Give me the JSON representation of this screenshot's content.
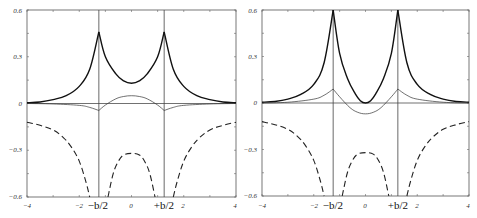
{
  "chart_data": [
    {
      "type": "line",
      "title": "",
      "xlabel": "",
      "ylabel": "",
      "xlim": [
        -4,
        4
      ],
      "ylim": [
        -0.6,
        0.6
      ],
      "grid": false,
      "x_ticks": [
        "-4",
        "-2",
        "0",
        "2",
        "4"
      ],
      "y_ticks": [
        "0.6",
        "0.3",
        "0",
        "-0.3",
        "-0.6"
      ],
      "annotations": [
        "-b/2",
        "+b/2"
      ],
      "vertical_lines_at": [
        -1.25,
        1.25
      ],
      "series": [
        {
          "name": "thick-solid",
          "style": "solid-thick",
          "x": [
            -4,
            -3.5,
            -3,
            -2.5,
            -2,
            -1.6,
            -1.25,
            -1.0,
            -0.6,
            -0.3,
            0,
            0.3,
            0.6,
            1.0,
            1.25,
            1.6,
            2,
            2.5,
            3,
            3.5,
            4
          ],
          "values": [
            0.005,
            0.01,
            0.025,
            0.05,
            0.11,
            0.22,
            0.46,
            0.3,
            0.19,
            0.145,
            0.13,
            0.145,
            0.19,
            0.3,
            0.46,
            0.22,
            0.11,
            0.05,
            0.025,
            0.01,
            0.005
          ]
        },
        {
          "name": "thin-solid",
          "style": "solid-thin",
          "x": [
            -4,
            -3,
            -2,
            -1.6,
            -1.25,
            -1.0,
            -0.6,
            -0.3,
            0,
            0.3,
            0.6,
            1.0,
            1.25,
            1.6,
            2,
            3,
            4
          ],
          "values": [
            0.0,
            -0.003,
            -0.012,
            -0.025,
            -0.045,
            -0.01,
            0.03,
            0.045,
            0.05,
            0.045,
            0.03,
            -0.01,
            -0.045,
            -0.025,
            -0.012,
            -0.003,
            0.0
          ]
        },
        {
          "name": "dashed",
          "style": "dashed",
          "segments": [
            {
              "x": [
                -4,
                -3.5,
                -3,
                -2.6,
                -2.3,
                -2.0,
                -1.75,
                -1.6
              ],
              "values": [
                -0.12,
                -0.14,
                -0.17,
                -0.22,
                -0.28,
                -0.37,
                -0.5,
                -0.6
              ]
            },
            {
              "x": [
                -0.9,
                -0.7,
                -0.5,
                -0.3,
                0,
                0.3,
                0.5,
                0.7,
                0.9
              ],
              "values": [
                -0.6,
                -0.45,
                -0.37,
                -0.33,
                -0.32,
                -0.33,
                -0.37,
                -0.45,
                -0.6
              ]
            },
            {
              "x": [
                1.6,
                1.75,
                2.0,
                2.3,
                2.6,
                3,
                3.5,
                4
              ],
              "values": [
                -0.6,
                -0.5,
                -0.37,
                -0.28,
                -0.22,
                -0.17,
                -0.14,
                -0.12
              ]
            }
          ]
        }
      ]
    },
    {
      "type": "line",
      "title": "",
      "xlabel": "",
      "ylabel": "",
      "xlim": [
        -4,
        4
      ],
      "ylim": [
        -0.6,
        0.6
      ],
      "grid": false,
      "x_ticks": [
        "-4",
        "-2",
        "0",
        "2",
        "4"
      ],
      "y_ticks": [
        "0.6",
        "0.3",
        "0",
        "-0.3",
        "-0.6"
      ],
      "annotations": [
        "-b/2",
        "+b/2"
      ],
      "vertical_lines_at": [
        -1.25,
        1.25
      ],
      "series": [
        {
          "name": "thick-solid",
          "style": "solid-thick",
          "x": [
            -4,
            -3.5,
            -3,
            -2.5,
            -2,
            -1.6,
            -1.25,
            -1.0,
            -0.7,
            -0.4,
            -0.2,
            0,
            0.2,
            0.4,
            0.7,
            1.0,
            1.25,
            1.6,
            2,
            2.5,
            3,
            3.5,
            4
          ],
          "values": [
            0.005,
            0.01,
            0.025,
            0.055,
            0.12,
            0.26,
            0.6,
            0.32,
            0.16,
            0.06,
            0.015,
            0.0,
            0.015,
            0.06,
            0.16,
            0.32,
            0.6,
            0.26,
            0.12,
            0.055,
            0.025,
            0.01,
            0.005
          ]
        },
        {
          "name": "thin-solid",
          "style": "solid-thin",
          "x": [
            -4,
            -3,
            -2,
            -1.6,
            -1.25,
            -1.0,
            -0.6,
            -0.3,
            0,
            0.3,
            0.6,
            1.0,
            1.25,
            1.6,
            2,
            3,
            4
          ],
          "values": [
            0.0,
            0.005,
            0.025,
            0.05,
            0.09,
            0.04,
            -0.03,
            -0.06,
            -0.07,
            -0.06,
            -0.03,
            0.04,
            0.09,
            0.05,
            0.025,
            0.005,
            0.0
          ]
        },
        {
          "name": "dashed",
          "style": "dashed",
          "segments": [
            {
              "x": [
                -4,
                -3.5,
                -3,
                -2.6,
                -2.3,
                -2.0,
                -1.75,
                -1.6
              ],
              "values": [
                -0.12,
                -0.14,
                -0.17,
                -0.22,
                -0.28,
                -0.37,
                -0.5,
                -0.6
              ]
            },
            {
              "x": [
                -0.9,
                -0.7,
                -0.5,
                -0.3,
                0,
                0.3,
                0.5,
                0.7,
                0.9
              ],
              "values": [
                -0.6,
                -0.45,
                -0.37,
                -0.33,
                -0.32,
                -0.33,
                -0.37,
                -0.45,
                -0.6
              ]
            },
            {
              "x": [
                1.6,
                1.75,
                2.0,
                2.3,
                2.6,
                3,
                3.5,
                4
              ],
              "values": [
                -0.6,
                -0.5,
                -0.37,
                -0.28,
                -0.22,
                -0.17,
                -0.14,
                -0.12
              ]
            }
          ]
        }
      ]
    }
  ],
  "panels": [
    {
      "x_tick_labels": [
        "−4",
        "−2",
        "0",
        "2",
        "4"
      ],
      "y_tick_labels": [
        "0.6",
        "0.3",
        "0",
        "−0.3",
        "−0.6"
      ],
      "minus_b_label": "−b/2",
      "plus_b_label": "+b/2"
    },
    {
      "x_tick_labels": [
        "−4",
        "−2",
        "0",
        "2",
        "4"
      ],
      "y_tick_labels": [
        "0.6",
        "0.3",
        "0",
        "−0.3",
        "−0.6"
      ],
      "minus_b_label": "−b/2",
      "plus_b_label": "+b/2"
    }
  ]
}
